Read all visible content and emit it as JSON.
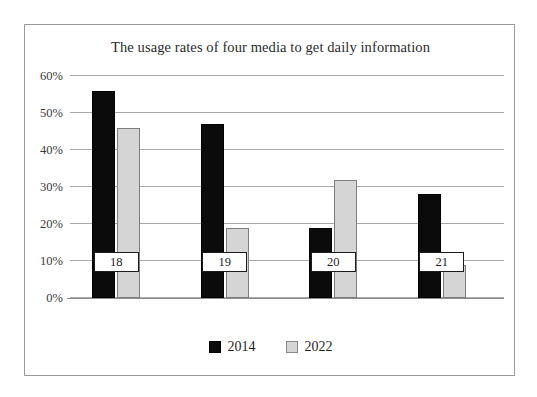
{
  "chart_data": {
    "type": "bar",
    "title": "The usage rates of four media to get daily information",
    "xlabel": "",
    "ylabel": "",
    "categories": [
      "18",
      "19",
      "20",
      "21"
    ],
    "series": [
      {
        "name": "2014",
        "color": "#0b0b0b",
        "values": [
          56,
          47,
          19,
          28
        ]
      },
      {
        "name": "2022",
        "color": "#d5d5d5",
        "values": [
          46,
          19,
          32,
          9
        ]
      }
    ],
    "ylim": [
      0,
      60
    ],
    "y_ticks": [
      0,
      10,
      20,
      30,
      40,
      50,
      60
    ],
    "y_tick_labels": [
      "0%",
      "10%",
      "20%",
      "30%",
      "40%",
      "50%",
      "60%"
    ],
    "grid": true,
    "legend_position": "bottom-center",
    "value_suffix": "%"
  },
  "legend": {
    "items": [
      {
        "label": "2014",
        "swatch": "black-square-swatch"
      },
      {
        "label": "2022",
        "swatch": "gray-square-swatch"
      }
    ]
  }
}
